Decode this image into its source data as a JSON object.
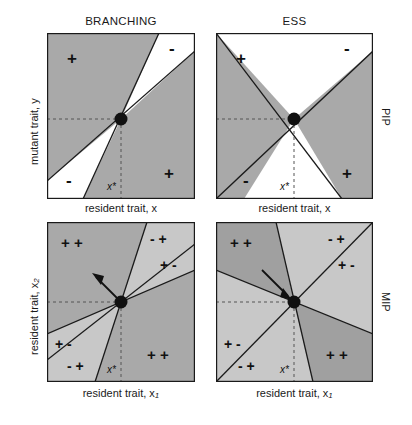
{
  "figure": {
    "column_titles": [
      {
        "id": "branching",
        "label": "BRANCHING"
      },
      {
        "id": "ess",
        "label": "ESS"
      }
    ],
    "row_labels": [
      {
        "id": "pip",
        "label": "PIP"
      },
      {
        "id": "mip",
        "label": "MIP"
      }
    ],
    "axes": {
      "pip_y": "mutant trait, y",
      "pip_x": "resident trait, x",
      "mip_y_prefix": "resident trait, x",
      "mip_y_sub": "2",
      "mip_x_prefix": "resident trait, x",
      "mip_x_sub": "1",
      "singular_point": "x*"
    },
    "colors": {
      "shaded": "#a9a9a9",
      "shaded_light": "#c4c4c4",
      "shaded_dark": "#9b9b9b",
      "unshaded": "#ffffff",
      "line": "#1a1a1a",
      "dashed": "#555555",
      "text": "#1a1a1a"
    }
  },
  "panels": [
    {
      "id": "pip-branching",
      "row": "PIP",
      "column": "BRANCHING",
      "type": "pairwise-invasibility-plot",
      "description": "Narrow white invasion wedges straddling the main diagonal; plus signs upper-left and lower-right, minus signs upper-right and lower-left.",
      "signs": [
        {
          "id": "upper-left",
          "label": "+"
        },
        {
          "id": "upper-right",
          "label": "-"
        },
        {
          "id": "lower-left",
          "label": "-"
        },
        {
          "id": "lower-right",
          "label": "+"
        }
      ]
    },
    {
      "id": "pip-ess",
      "row": "PIP",
      "column": "ESS",
      "type": "pairwise-invasibility-plot",
      "description": "X-shaped partition with grey left and right wedges, white top and bottom wedges.",
      "signs": [
        {
          "id": "upper-left",
          "label": "+"
        },
        {
          "id": "upper-right",
          "label": "-"
        },
        {
          "id": "lower-left",
          "label": "-"
        },
        {
          "id": "lower-right",
          "label": "+"
        }
      ]
    },
    {
      "id": "mip-branching",
      "row": "MIP",
      "column": "BRANCHING",
      "type": "mutual-invasibility-plot",
      "arrow": "divergent",
      "description": "Six sectors around the singular point; arrow points away from the singular point indicating divergence.",
      "signs": [
        {
          "id": "upper-left",
          "label": "+ +"
        },
        {
          "id": "upper-right-outer",
          "label": "- +"
        },
        {
          "id": "upper-right-inner",
          "label": "+ -"
        },
        {
          "id": "lower-left-outer",
          "label": "+ -"
        },
        {
          "id": "lower-left-inner",
          "label": "- +"
        },
        {
          "id": "lower-right",
          "label": "+ +"
        }
      ]
    },
    {
      "id": "mip-ess",
      "row": "MIP",
      "column": "ESS",
      "type": "mutual-invasibility-plot",
      "arrow": "convergent",
      "description": "Six sectors around the singular point; arrow points toward the singular point indicating convergence.",
      "signs": [
        {
          "id": "upper-left",
          "label": "+ +"
        },
        {
          "id": "upper-right-outer",
          "label": "- +"
        },
        {
          "id": "upper-right-inner",
          "label": "+ -"
        },
        {
          "id": "lower-left-outer",
          "label": "+ -"
        },
        {
          "id": "lower-left-inner",
          "label": "- +"
        },
        {
          "id": "lower-right",
          "label": "+ +"
        }
      ]
    }
  ]
}
